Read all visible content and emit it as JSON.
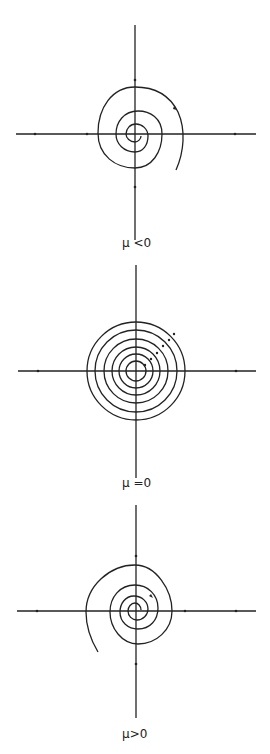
{
  "figure": {
    "panels": [
      {
        "label": "μ <0",
        "center": [
          135,
          133
        ],
        "type": "stable-spiral"
      },
      {
        "label": "μ =0",
        "center": [
          136,
          371
        ],
        "type": "center-circles",
        "radii": [
          10,
          17,
          24,
          32,
          41,
          49
        ]
      },
      {
        "label": "μ>0",
        "center": [
          136,
          611
        ],
        "type": "unstable-spiral"
      }
    ],
    "stroke_color": "#222222",
    "background": "#ffffff"
  }
}
